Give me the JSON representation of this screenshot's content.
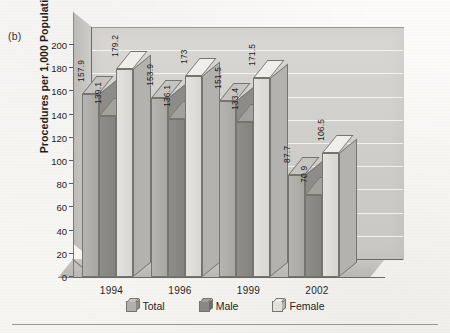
{
  "panel": {
    "label": "(b)"
  },
  "axes": {
    "y_title": "Procedures per 1,000 Population",
    "y_ticks": [
      "200",
      "180",
      "160",
      "140",
      "120",
      "100",
      "80",
      "60",
      "40",
      "20",
      "0"
    ]
  },
  "legend": {
    "items": [
      {
        "label": "Total",
        "swatch": "swatch-total",
        "color": "#b2b0ac"
      },
      {
        "label": "Male",
        "swatch": "swatch-male",
        "color": "#8a8884"
      },
      {
        "label": "Female",
        "swatch": "swatch-female",
        "color": "#e2e0dc"
      }
    ]
  },
  "chart_data": {
    "type": "bar",
    "title": "",
    "subtitle": "",
    "xlabel": "",
    "ylabel": "Procedures per 1,000 Population",
    "ylim": [
      0,
      200
    ],
    "ytick_step": 20,
    "grid": true,
    "legend_position": "bottom",
    "three_d": true,
    "categories": [
      "1994",
      "1996",
      "1999",
      "2002"
    ],
    "series": [
      {
        "name": "Total",
        "color": "#b2b0ac",
        "values": [
          157.9,
          153.9,
          151.5,
          87.7
        ]
      },
      {
        "name": "Male",
        "color": "#8a8884",
        "values": [
          139.1,
          136.1,
          133.4,
          70.9
        ]
      },
      {
        "name": "Female",
        "color": "#e2e0dc",
        "values": [
          179.2,
          173.0,
          171.5,
          106.5
        ]
      }
    ],
    "data_labels": [
      [
        "157.9",
        "139.1",
        "179.2"
      ],
      [
        "153.9",
        "136.1",
        "173"
      ],
      [
        "151.5",
        "133.4",
        "171.5"
      ],
      [
        "87.7",
        "70.9",
        "106.5"
      ]
    ]
  }
}
